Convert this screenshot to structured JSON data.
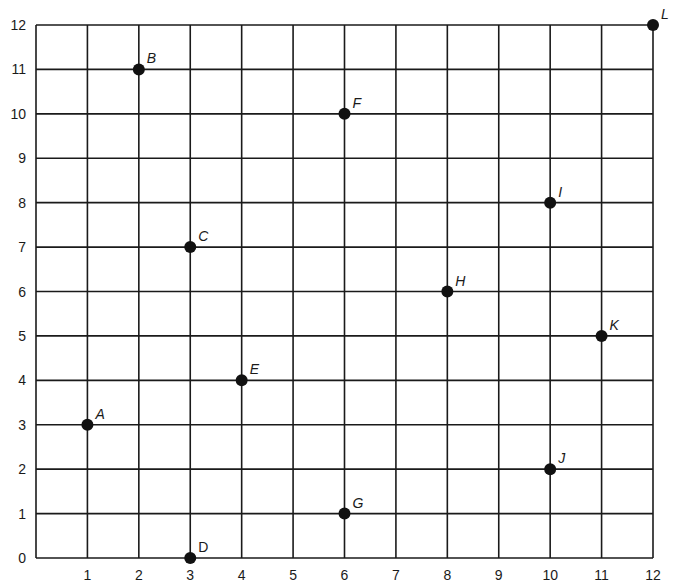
{
  "chart_data": {
    "type": "scatter",
    "title": "",
    "xlabel": "",
    "ylabel": "",
    "xlim": [
      0,
      12
    ],
    "ylim": [
      0,
      12
    ],
    "grid": true,
    "legend": null,
    "x_ticks": [
      "1",
      "2",
      "3",
      "4",
      "5",
      "6",
      "7",
      "8",
      "9",
      "10",
      "11",
      "12"
    ],
    "y_ticks": [
      "0",
      "1",
      "2",
      "3",
      "4",
      "5",
      "6",
      "7",
      "8",
      "9",
      "10",
      "11",
      "12"
    ],
    "points": [
      {
        "label": "A",
        "x": 1,
        "y": 3,
        "italic": true
      },
      {
        "label": "B",
        "x": 2,
        "y": 11,
        "italic": true
      },
      {
        "label": "C",
        "x": 3,
        "y": 7,
        "italic": true
      },
      {
        "label": "D",
        "x": 3,
        "y": 0,
        "italic": false
      },
      {
        "label": "E",
        "x": 4,
        "y": 4,
        "italic": true
      },
      {
        "label": "F",
        "x": 6,
        "y": 10,
        "italic": true
      },
      {
        "label": "G",
        "x": 6,
        "y": 1,
        "italic": true
      },
      {
        "label": "H",
        "x": 8,
        "y": 6,
        "italic": true
      },
      {
        "label": "I",
        "x": 10,
        "y": 8,
        "italic": true
      },
      {
        "label": "J",
        "x": 10,
        "y": 2,
        "italic": true
      },
      {
        "label": "K",
        "x": 11,
        "y": 5,
        "italic": true
      },
      {
        "label": "L",
        "x": 12,
        "y": 12,
        "italic": true
      }
    ],
    "colors": {
      "grid": "#1a1a1a",
      "points": "#111111",
      "background": "#ffffff"
    }
  }
}
